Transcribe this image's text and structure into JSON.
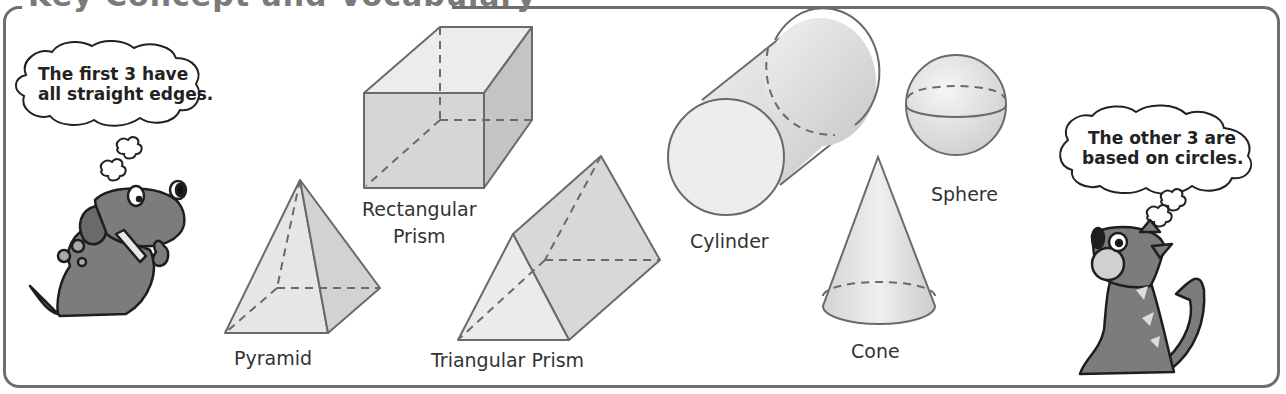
{
  "header": {
    "title": "Key Concept and Vocabulary"
  },
  "shapes": {
    "pyramid": {
      "label": "Pyramid"
    },
    "rectangular_prism": {
      "label_line1": "Rectangular",
      "label_line2": "Prism"
    },
    "triangular_prism": {
      "label": "Triangular Prism"
    },
    "cylinder": {
      "label": "Cylinder"
    },
    "cone": {
      "label": "Cone"
    },
    "sphere": {
      "label": "Sphere"
    }
  },
  "characters": {
    "dog": {
      "speech_line1": "The first 3 have",
      "speech_line2": "all straight edges."
    },
    "cat": {
      "speech_line1": "The other 3 are",
      "speech_line2": "based on circles."
    }
  },
  "colors": {
    "frame": "#6e6e6e",
    "shape_fill": "#e2e2e2",
    "shape_stroke": "#6a6a6a",
    "character_fill": "#7c7c7c"
  }
}
